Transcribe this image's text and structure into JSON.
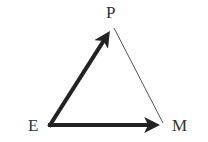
{
  "diagram": {
    "type": "vector-triangle",
    "vertices": {
      "P": {
        "label": "P",
        "x": 114,
        "y": 28
      },
      "E": {
        "label": "E",
        "x": 49,
        "y": 125
      },
      "M": {
        "label": "M",
        "x": 163,
        "y": 125
      }
    },
    "edges": [
      {
        "from": "E",
        "to": "P",
        "style": "thick-arrow"
      },
      {
        "from": "E",
        "to": "M",
        "style": "thick-arrow"
      },
      {
        "from": "P",
        "to": "M",
        "style": "thin-line"
      }
    ],
    "colors": {
      "arrow": "#222222",
      "thin_line": "#555555",
      "label": "#333333"
    }
  }
}
